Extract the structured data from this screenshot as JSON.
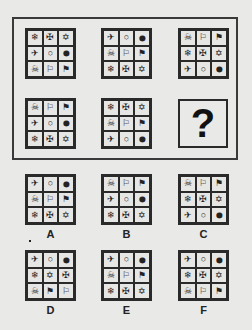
{
  "symbols": {
    "snowflake": "❄",
    "cross": "✠",
    "star": "✡",
    "plane": "✈",
    "sun": "☼",
    "drop": "💧",
    "skull": "☠",
    "flag": "⚐",
    "pennant": "⚑"
  },
  "question_mark": "?",
  "puzzle": [
    {
      "cells": [
        "❄",
        "✠",
        "✡",
        "✈",
        "○",
        "⬤",
        "☠",
        "⚐",
        "⚑"
      ]
    },
    {
      "cells": [
        "✈",
        "○",
        "⬤",
        "☠",
        "⚐",
        "⚑",
        "❄",
        "✠",
        "✡"
      ]
    },
    {
      "cells": [
        "☠",
        "⚐",
        "⚑",
        "❄",
        "✠",
        "✡",
        "✈",
        "○",
        "⬤"
      ]
    },
    {
      "cells": [
        "☠",
        "⚐",
        "⚑",
        "✈",
        "○",
        "⬤",
        "❄",
        "✠",
        "✡"
      ]
    },
    {
      "cells": [
        "❄",
        "✠",
        "✡",
        "☠",
        "⚐",
        "⚑",
        "✈",
        "○",
        "⬤"
      ]
    }
  ],
  "options": [
    {
      "label": "A",
      "cells": [
        "✈",
        "○",
        "⬤",
        "☠",
        "⚐",
        "⚑",
        "❄",
        "✠",
        "✡"
      ]
    },
    {
      "label": "B",
      "cells": [
        "☠",
        "⚐",
        "⚑",
        "✈",
        "○",
        "⬤",
        "❄",
        "✠",
        "✡"
      ]
    },
    {
      "label": "C",
      "cells": [
        "☠",
        "⚐",
        "⚑",
        "❄",
        "✠",
        "✡",
        "✈",
        "○",
        "⬤"
      ]
    },
    {
      "label": "D",
      "cells": [
        "✈",
        "○",
        "⬤",
        "❄",
        "✡",
        "✠",
        "☠",
        "⚑",
        "⚐"
      ]
    },
    {
      "label": "E",
      "cells": [
        "✈",
        "○",
        "⬤",
        "☠",
        "⚐",
        "⚑",
        "❄",
        "✠",
        "✡"
      ]
    },
    {
      "label": "F",
      "cells": [
        "✈",
        "○",
        "⬤",
        "❄",
        "✠",
        "✡",
        "☠",
        "⚐",
        "⚑"
      ]
    }
  ]
}
